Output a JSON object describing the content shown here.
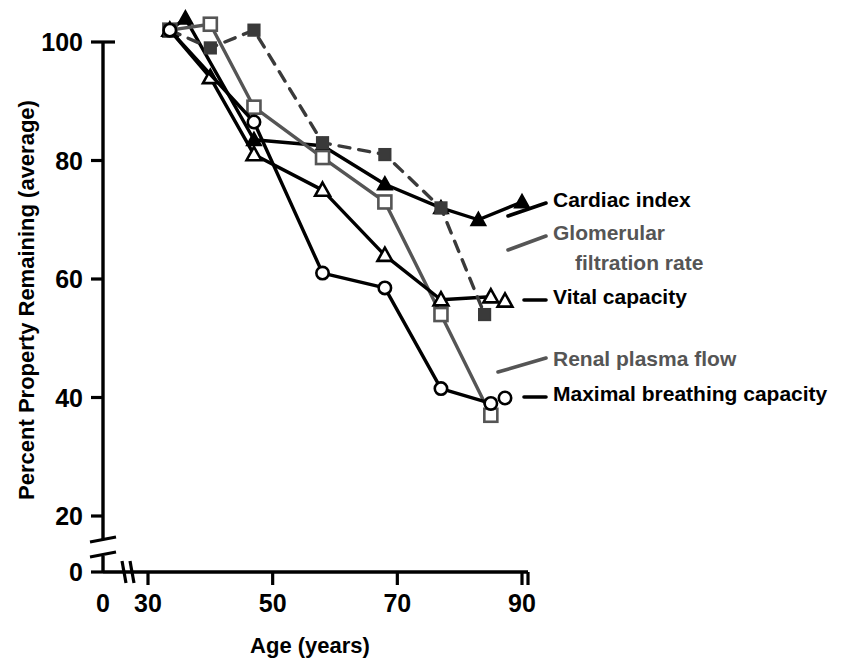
{
  "chart_data": {
    "type": "line",
    "title": "",
    "xlabel": "Age (years)",
    "ylabel": "Percent Property Remaining (average)",
    "xlim": [
      28,
      91
    ],
    "ylim": [
      0,
      104
    ],
    "xticks": [
      0,
      30,
      50,
      70,
      90
    ],
    "yticks": [
      0,
      20,
      40,
      60,
      80,
      100
    ],
    "xtick_labels": [
      "0",
      "30",
      "50",
      "70",
      "90"
    ],
    "ytick_labels": [
      "0",
      "20",
      "40",
      "60",
      "80",
      "100"
    ],
    "grid": false,
    "legend_position": "right",
    "axis_break_x": true,
    "axis_break_y": true,
    "series": [
      {
        "name": "Cardiac index",
        "marker": "filled-triangle",
        "line_style": "solid",
        "color": "#000000",
        "x": [
          33.5,
          36,
          47,
          58,
          68,
          77,
          83,
          90
        ],
        "y": [
          102,
          104,
          83.5,
          82.5,
          76,
          72,
          70,
          73
        ]
      },
      {
        "name": "Glomerular filtration rate",
        "marker": "open-square",
        "line_style": "solid",
        "color": "#555555",
        "x": [
          33.5,
          40,
          47,
          58,
          68,
          77,
          85
        ],
        "y": [
          102,
          103,
          89,
          80.5,
          73,
          54,
          37
        ]
      },
      {
        "name": "Vital capacity",
        "marker": "open-triangle",
        "line_style": "solid",
        "color": "#000000",
        "x": [
          33.5,
          40,
          47,
          58,
          68,
          77,
          85
        ],
        "y": [
          102,
          94,
          81,
          75,
          64,
          56.5,
          57
        ]
      },
      {
        "name": "Renal plasma flow",
        "marker": "filled-square",
        "line_style": "dashed",
        "color": "#3a3a3a",
        "x": [
          33.5,
          40,
          47,
          58,
          68,
          77,
          84
        ],
        "y": [
          102,
          99,
          102,
          83,
          81,
          72,
          54
        ]
      },
      {
        "name": "Maximal breathing capacity",
        "marker": "open-circle",
        "line_style": "solid",
        "color": "#000000",
        "x": [
          33.5,
          47,
          58,
          68,
          77,
          85
        ],
        "y": [
          102,
          86.5,
          61,
          58.5,
          41.5,
          39
        ]
      }
    ]
  },
  "legend": {
    "entries": [
      {
        "label": "Cardiac index",
        "color": "#000000",
        "marker": "filled-triangle",
        "style": "solid"
      },
      {
        "label": "Glomerular",
        "color": "#555555",
        "marker": "open-square",
        "style": "solid"
      },
      {
        "label": "filtration rate",
        "color": "#555555",
        "marker": "none",
        "style": "none"
      },
      {
        "label": "Vital capacity",
        "color": "#000000",
        "marker": "open-triangle",
        "style": "solid"
      },
      {
        "label": "Renal plasma flow",
        "color": "#555555",
        "marker": "filled-square",
        "style": "dashed"
      },
      {
        "label": "Maximal breathing capacity",
        "color": "#000000",
        "marker": "open-circle",
        "style": "solid"
      }
    ]
  },
  "footer": {
    "partial_text": ""
  }
}
